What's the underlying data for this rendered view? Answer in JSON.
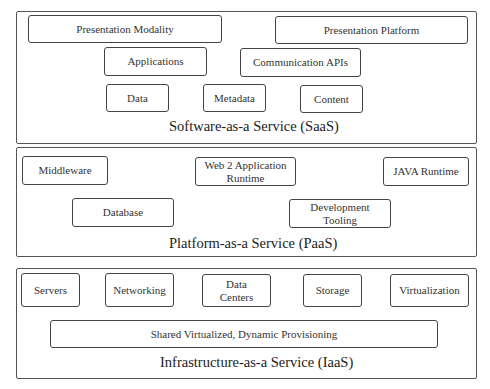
{
  "layers": {
    "saas": {
      "label": "Software-as-a Service (SaaS)",
      "components": {
        "presentation_modality": "Presentation Modality",
        "presentation_platform": "Presentation Platform",
        "applications": "Applications",
        "communication_apis": "Communication APIs",
        "data": "Data",
        "metadata": "Metadata",
        "content": "Content"
      }
    },
    "paas": {
      "label": "Platform-as-a Service (PaaS)",
      "components": {
        "middleware": "Middleware",
        "web2_runtime_line1": "Web 2 Application",
        "web2_runtime_line2": "Runtime",
        "java_runtime": "JAVA Runtime",
        "database": "Database",
        "dev_tooling_line1": "Development",
        "dev_tooling_line2": "Tooling"
      }
    },
    "iaas": {
      "label": "Infrastructure-as-a Service (IaaS)",
      "components": {
        "servers": "Servers",
        "networking": "Networking",
        "data_centers_line1": "Data",
        "data_centers_line2": "Centers",
        "storage": "Storage",
        "virtualization": "Virtualization",
        "shared_provisioning": "Shared Virtualized, Dynamic Provisioning"
      }
    }
  }
}
